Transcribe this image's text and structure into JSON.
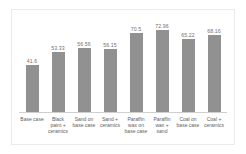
{
  "chart_data": {
    "type": "bar",
    "title": "",
    "subtitle": "",
    "xlabel": "",
    "ylabel": "",
    "ylim": [
      0,
      80
    ],
    "grid": false,
    "legend": "none",
    "bar_color": "#919191",
    "label_color": "#6f6f6f",
    "categories": [
      "Base case",
      "Black paint + ceramics",
      "Sand on base case",
      "Sand + ceramics",
      "Paraffin wax on base case",
      "Paraffin wax + sand",
      "Coal on base case",
      "Coal + ceramics"
    ],
    "values": [
      41.6,
      53.33,
      56.56,
      56.15,
      70.5,
      72.96,
      65.22,
      68.16
    ],
    "value_labels": [
      "41.6",
      "53.33",
      "56.56",
      "56.15",
      "70.5",
      "72.96",
      "65.22",
      "68.16"
    ]
  }
}
